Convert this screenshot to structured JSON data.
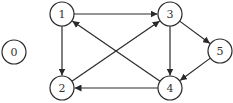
{
  "diagram": {
    "type": "directed-graph",
    "colors": {
      "stroke": "#2a2a2a",
      "label": "#333333",
      "background": "#ffffff"
    },
    "node_radius": 12,
    "nodes": [
      {
        "id": "0",
        "label": "0",
        "x": 14,
        "y": 52
      },
      {
        "id": "1",
        "label": "1",
        "x": 62,
        "y": 14
      },
      {
        "id": "2",
        "label": "2",
        "x": 62,
        "y": 88
      },
      {
        "id": "3",
        "label": "3",
        "x": 170,
        "y": 14
      },
      {
        "id": "4",
        "label": "4",
        "x": 170,
        "y": 88
      },
      {
        "id": "5",
        "label": "5",
        "x": 220,
        "y": 51
      }
    ],
    "edges": [
      {
        "from": "1",
        "to": "3"
      },
      {
        "from": "1",
        "to": "2"
      },
      {
        "from": "2",
        "to": "3"
      },
      {
        "from": "4",
        "to": "1"
      },
      {
        "from": "3",
        "to": "4"
      },
      {
        "from": "3",
        "to": "5"
      },
      {
        "from": "5",
        "to": "4"
      },
      {
        "from": "4",
        "to": "2"
      }
    ]
  }
}
